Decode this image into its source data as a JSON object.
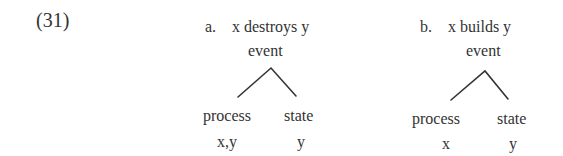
{
  "example_number": "(31)",
  "examples": [
    {
      "label": "a.",
      "sentence": "x destroys y",
      "tree": {
        "root": "event",
        "children": [
          {
            "node": "process",
            "args": "x,y"
          },
          {
            "node": "state",
            "args": "y"
          }
        ]
      }
    },
    {
      "label": "b.",
      "sentence": "x builds y",
      "tree": {
        "root": "event",
        "children": [
          {
            "node": "process",
            "args": "x"
          },
          {
            "node": "state",
            "args": "y"
          }
        ]
      }
    }
  ],
  "colors": {
    "text": "#333333",
    "lines": "#333333"
  }
}
